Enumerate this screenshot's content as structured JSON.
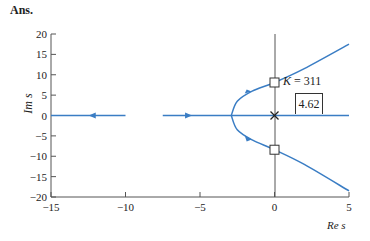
{
  "header": {
    "label": "Ans."
  },
  "annotations": {
    "k_label_prefix": "K",
    "k_label_suffix": " = 311",
    "box_value": "4.62"
  },
  "colors": {
    "locus": "#3a7dc4",
    "axis": "#555555"
  },
  "chart_data": {
    "type": "line",
    "title": "",
    "xlabel": "Re s",
    "ylabel": "Im s",
    "xlim": [
      -15,
      5
    ],
    "ylim": [
      -20,
      20
    ],
    "xticks": [
      -15,
      -10,
      -5,
      0,
      5
    ],
    "yticks": [
      20,
      15,
      10,
      5,
      0,
      -5,
      -10,
      -15,
      -20
    ],
    "grid": false,
    "series": [
      {
        "name": "real-axis branch left (arrow toward -inf)",
        "x": [
          -15,
          -10
        ],
        "y": [
          0,
          0
        ],
        "arrow_at": -12.2,
        "direction": "left"
      },
      {
        "name": "real-axis branch right",
        "x": [
          -7.5,
          5
        ],
        "y": [
          0,
          0
        ],
        "arrow_at": -5.8,
        "direction": "right"
      },
      {
        "name": "upper complex branch",
        "points": [
          [
            -2.9,
            0
          ],
          [
            -2.5,
            3.5
          ],
          [
            -1.5,
            6
          ],
          [
            0,
            8.1
          ],
          [
            2,
            11.5
          ],
          [
            5,
            17.5
          ]
        ]
      },
      {
        "name": "lower complex branch",
        "points": [
          [
            -2.9,
            0
          ],
          [
            -2.5,
            -3.5
          ],
          [
            -1.5,
            -6
          ],
          [
            0,
            -8.4
          ],
          [
            2,
            -12
          ],
          [
            5,
            -18.5
          ]
        ]
      }
    ],
    "markers": [
      {
        "type": "pole",
        "symbol": "x",
        "x": 0,
        "y": 0
      },
      {
        "type": "crossing",
        "symbol": "square",
        "x": 0,
        "y": 8.1
      },
      {
        "type": "crossing",
        "symbol": "square",
        "x": 0,
        "y": -8.4
      }
    ],
    "annotations": [
      {
        "text": "K = 311",
        "x": 0.5,
        "y": 10
      },
      {
        "text": "4.62",
        "x": 1.4,
        "y": 4,
        "boxed": true
      }
    ]
  }
}
